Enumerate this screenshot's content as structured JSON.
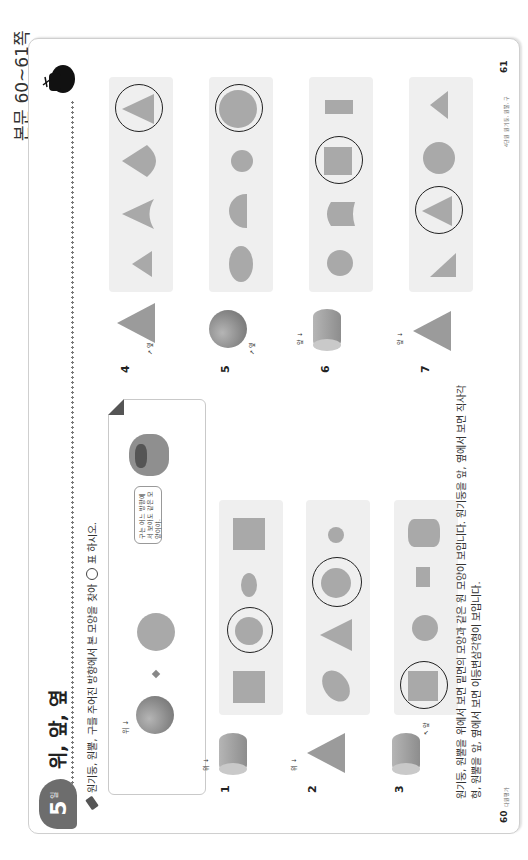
{
  "reference": "본문 60~61쪽",
  "header": {
    "day_number": "5",
    "day_unit": "일",
    "title": "위, 앞, 옆"
  },
  "instruction": {
    "icon": "pencil-icon",
    "text_before": "원기둥, 원뿔, 구를 주어진 방향에서 본 모양을 찾아",
    "text_after": "표 하시오."
  },
  "example": {
    "direction_label": "위",
    "speech": "구는 어느 방향에서 보아도 같은 모양이야."
  },
  "problems": [
    {
      "number": "1",
      "solid": "cylinder",
      "direction": "위",
      "options": [
        "square",
        "circle",
        "small-ellipse",
        "square"
      ],
      "answer_index": 1
    },
    {
      "number": "2",
      "solid": "cone",
      "direction": "위",
      "options": [
        "ellipse",
        "triangle",
        "circle",
        "small-circle"
      ],
      "answer_index": 2
    },
    {
      "number": "3",
      "solid": "cylinder",
      "direction": "앞",
      "options": [
        "square",
        "circle",
        "rectangle",
        "rounded-rect"
      ],
      "answer_index": 0
    },
    {
      "number": "4",
      "solid": "cone",
      "direction": "옆",
      "options": [
        "small-triangle",
        "concave-triangle",
        "rounded-triangle",
        "triangle"
      ],
      "answer_index": 3
    },
    {
      "number": "5",
      "solid": "sphere",
      "direction": "옆",
      "options": [
        "ellipse",
        "half-circle",
        "small-circle",
        "circle"
      ],
      "answer_index": 3
    },
    {
      "number": "6",
      "solid": "cylinder",
      "direction": "앞",
      "options": [
        "circle",
        "concave-rect",
        "square",
        "rectangle"
      ],
      "answer_index": 2
    },
    {
      "number": "7",
      "solid": "cone",
      "direction": "앞",
      "options": [
        "right-triangle",
        "triangle",
        "circle",
        "small-triangle"
      ],
      "answer_index": 1
    }
  ],
  "explanation": "원기둥, 원뿔을 위에서 보면 밑면의 모양과 같은 원 모양이 보입니다. 원기둥을 앞, 옆에서 보면 직사각형, 원뿔을 앞, 옆에서 보면 이등변삼각형이 보입니다.",
  "footer": {
    "left_page": "60",
    "left_small": "다원평가",
    "right_small": "4단원 원기둥, 원뿔, 구",
    "right_page": "61"
  },
  "colors": {
    "shape_fill": "#a9a9a9",
    "panel_bg": "#efefef",
    "badge": "#6d6d6d",
    "answer_ring": "#222222"
  }
}
